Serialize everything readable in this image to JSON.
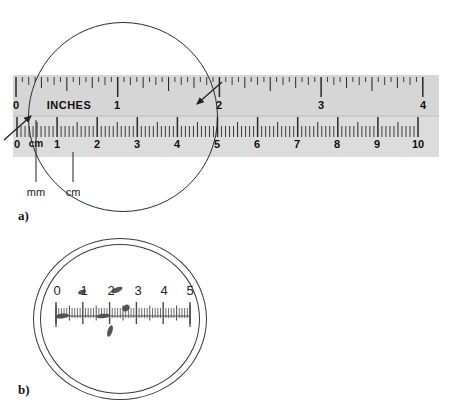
{
  "figure": {
    "panels": [
      {
        "id": "a",
        "caption": "a)"
      },
      {
        "id": "b",
        "caption": "b)"
      }
    ]
  },
  "ruler": {
    "inch_scale_word": "INCHES",
    "inch_labels": [
      "0",
      "1",
      "2",
      "3",
      "4"
    ],
    "cm_scale_word": "cm",
    "cm_labels": [
      "0",
      "1",
      "2",
      "3",
      "4",
      "5",
      "6",
      "7",
      "8",
      "9",
      "10"
    ],
    "band_color": "#d9d9d9",
    "tick_color": "#2a2a2a"
  },
  "annotations": {
    "mm_label": "mm",
    "cm_label": "cm"
  },
  "magnifier": {
    "scale_labels": [
      "0",
      "1",
      "2",
      "3",
      "4",
      "5"
    ]
  }
}
